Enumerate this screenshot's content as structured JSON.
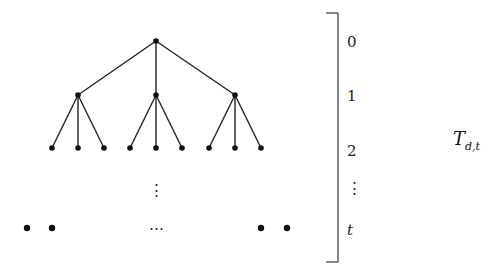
{
  "diagram": {
    "title": "T",
    "title_subscript": "d,t",
    "colors": {
      "edge": "#222222",
      "node": "#111111",
      "bracket": "#444444",
      "background": "#ffffff"
    },
    "tree": {
      "root": {
        "x": 156,
        "y": 41
      },
      "level1": [
        {
          "x": 78,
          "y": 95
        },
        {
          "x": 156,
          "y": 95
        },
        {
          "x": 235,
          "y": 95
        }
      ],
      "level2": [
        {
          "x": 52,
          "y": 148,
          "parent": 0
        },
        {
          "x": 78,
          "y": 148,
          "parent": 0
        },
        {
          "x": 104,
          "y": 148,
          "parent": 0
        },
        {
          "x": 130,
          "y": 148,
          "parent": 1
        },
        {
          "x": 156,
          "y": 148,
          "parent": 1
        },
        {
          "x": 182,
          "y": 148,
          "parent": 1
        },
        {
          "x": 209,
          "y": 148,
          "parent": 2
        },
        {
          "x": 235,
          "y": 148,
          "parent": 2
        },
        {
          "x": 261,
          "y": 148,
          "parent": 2
        }
      ],
      "vertical_ellipsis": "⋮",
      "bottom_left_nodes": [
        {
          "x": 27,
          "y": 228
        },
        {
          "x": 52,
          "y": 228
        }
      ],
      "bottom_right_nodes": [
        {
          "x": 261,
          "y": 228
        },
        {
          "x": 287,
          "y": 228
        }
      ],
      "horizontal_ellipsis": "⋯"
    },
    "bracket": {
      "levels": [
        {
          "label": "0",
          "y": 47,
          "italic": false
        },
        {
          "label": "1",
          "y": 101,
          "italic": false
        },
        {
          "label": "2",
          "y": 156,
          "italic": false
        },
        {
          "label": "⋮",
          "y": 193,
          "italic": false
        },
        {
          "label": "t",
          "y": 235,
          "italic": true
        }
      ]
    }
  }
}
